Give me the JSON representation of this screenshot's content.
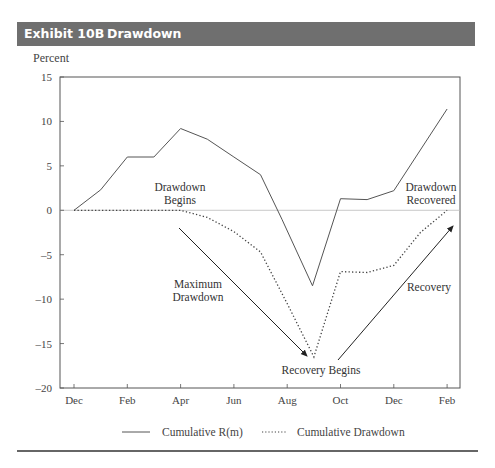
{
  "header": {
    "exhibit_number": "Exhibit 10B",
    "title": "Drawdown",
    "bar_color": "#6f6f6f"
  },
  "y_unit_label": "Percent",
  "legend": {
    "series1": "Cumulative R(m)",
    "series2": "Cumulative Drawdown"
  },
  "annotations": {
    "drawdown_begins": [
      "Drawdown",
      "Begins"
    ],
    "maximum_drawdown": [
      "Maximum",
      "Drawdown"
    ],
    "recovery_begins": "Recovery Begins",
    "recovery": "Recovery",
    "drawdown_recovered": [
      "Drawdown",
      "Recovered"
    ]
  },
  "chart_data": {
    "type": "line",
    "title": "Exhibit 10B Drawdown",
    "xlabel": "",
    "ylabel": "Percent",
    "ylim": [
      -20,
      15
    ],
    "yticks": [
      15,
      10,
      5,
      0,
      -5,
      -10,
      -15,
      -20
    ],
    "xtick_labels": [
      "Dec",
      "Feb",
      "Apr",
      "Jun",
      "Aug",
      "Oct",
      "Dec",
      "Feb"
    ],
    "x_months": [
      "Dec",
      "Jan",
      "Feb",
      "Mar",
      "Apr",
      "May",
      "Jun",
      "Jul",
      "Aug",
      "Sep-mid",
      "Oct",
      "Nov",
      "Dec",
      "Jan",
      "Feb"
    ],
    "x": [
      0,
      1,
      2,
      3,
      4,
      5,
      6,
      7,
      8,
      9,
      10,
      11,
      12,
      13,
      14
    ],
    "series": [
      {
        "name": "Cumulative R(m)",
        "style": "solid",
        "points": [
          [
            0,
            0
          ],
          [
            1,
            2.3
          ],
          [
            2,
            6.0
          ],
          [
            3,
            6.0
          ],
          [
            4,
            9.2
          ],
          [
            5,
            8.0
          ],
          [
            6,
            6.0
          ],
          [
            7,
            4.0
          ],
          [
            7.8,
            -1.0
          ],
          [
            8.95,
            -8.5
          ],
          [
            10,
            1.3
          ],
          [
            11,
            1.2
          ],
          [
            12,
            2.2
          ],
          [
            14,
            11.4
          ]
        ]
      },
      {
        "name": "Cumulative Drawdown",
        "style": "dotted",
        "points": [
          [
            0,
            0
          ],
          [
            1,
            0
          ],
          [
            2,
            0
          ],
          [
            3,
            0
          ],
          [
            4,
            0
          ],
          [
            5,
            -0.8
          ],
          [
            6,
            -2.4
          ],
          [
            7,
            -4.7
          ],
          [
            8,
            -10.5
          ],
          [
            9,
            -16.5
          ],
          [
            10,
            -6.9
          ],
          [
            11,
            -7.0
          ],
          [
            12,
            -6.2
          ],
          [
            13,
            -2.5
          ],
          [
            14,
            0
          ]
        ]
      }
    ],
    "reference_line": 0,
    "legend_position": "bottom",
    "grid": false
  }
}
